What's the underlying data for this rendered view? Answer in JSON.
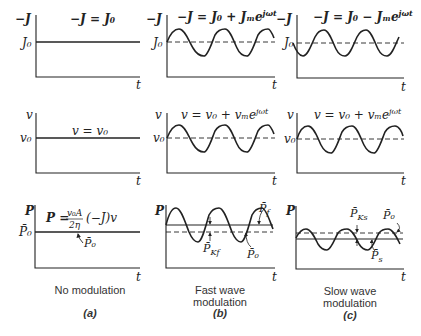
{
  "figure": {
    "columns": [
      {
        "id": "a",
        "caption": "No modulation",
        "tag": "(a)",
        "plots": [
          {
            "ylabel": "−J",
            "level_label": "J₀",
            "equation": "−J = J₀",
            "xlabel": "t",
            "waveform": "flat"
          },
          {
            "ylabel": "v",
            "level_label": "v₀",
            "equation": "v = v₀",
            "xlabel": "t",
            "waveform": "flat"
          },
          {
            "ylabel": "P",
            "level_label": "P̄₀",
            "equation_lhs": "P =",
            "equation_num": "v₀A",
            "equation_den": "2η",
            "equation_rhs": "(−J)v",
            "xlabel": "t",
            "waveform": "flat",
            "annotations": [
              "P̄₀"
            ]
          }
        ]
      },
      {
        "id": "b",
        "caption_line1": "Fast wave",
        "caption_line2": "modulation",
        "tag": "(b)",
        "plots": [
          {
            "ylabel": "−J",
            "level_label": "J₀",
            "equation": "−J = J₀ + Jₘe^{jωt}",
            "eq_base": "−J = J₀ + Jₘe",
            "eq_sup": "jωt",
            "xlabel": "t",
            "waveform": "sine-in-phase"
          },
          {
            "ylabel": "v",
            "level_label": "v₀",
            "equation": "v = v₀ + vₘe^{jωt}",
            "eq_base": "v = v₀ + vₘe",
            "eq_sup": "jωt",
            "xlabel": "t",
            "waveform": "sine-in-phase"
          },
          {
            "ylabel": "P",
            "xlabel": "t",
            "waveform": "sine-raised",
            "annotations": {
              "mean": "P̄_f",
              "mean_base": "P̄",
              "mean_sub": "f",
              "kinetic": "P̄_Kf",
              "kinetic_base": "P̄",
              "kinetic_sub": "Kf",
              "dc": "P̄₀"
            }
          }
        ]
      },
      {
        "id": "c",
        "caption_line1": "Slow wave",
        "caption_line2": "modulation",
        "tag": "(c)",
        "plots": [
          {
            "ylabel": "−J",
            "level_label": "J₀",
            "equation": "−J = J₀ − Jₘe^{jωt}",
            "eq_base": "−J = J₀ − Jₘe",
            "eq_sup": "jωt",
            "xlabel": "t",
            "waveform": "sine-antiphase"
          },
          {
            "ylabel": "v",
            "level_label": "v₀",
            "equation": "v = v₀ + vₘe^{jωt}",
            "eq_base": "v = v₀ + vₘe",
            "eq_sup": "jωt",
            "xlabel": "t",
            "waveform": "sine-in-phase"
          },
          {
            "ylabel": "P",
            "xlabel": "t",
            "waveform": "sine-lowered",
            "annotations": {
              "mean": "P̄_s",
              "mean_base": "P̄",
              "mean_sub": "s",
              "kinetic": "P̄_Ks",
              "kinetic_base": "P̄",
              "kinetic_sub": "Ks",
              "dc": "P̄₀"
            }
          }
        ]
      }
    ]
  }
}
